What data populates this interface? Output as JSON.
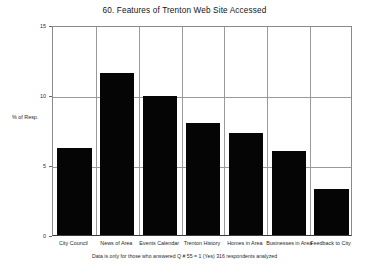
{
  "chart_data": {
    "type": "bar",
    "title": "60. Features of Trenton Web Site Accessed",
    "xlabel": "",
    "ylabel": "% of Resp.",
    "categories": [
      "City Council",
      "News of Area",
      "Events Calendar",
      "Trenton History",
      "Homes in Area",
      "Businesses in Area",
      "Feedback to City"
    ],
    "values": [
      6.2,
      11.6,
      9.9,
      8.0,
      7.3,
      6.0,
      3.3
    ],
    "ylim": [
      0,
      15
    ],
    "yticks": [
      0,
      5,
      10,
      15
    ],
    "ytick_labels": [
      "0",
      "5",
      "10",
      "15"
    ],
    "grid": true,
    "legend": "none",
    "bar_color": "#050505",
    "annotation": "Data is only for those who answered Q # 55 = 1 (Yes)   316 respondents analyzed"
  }
}
